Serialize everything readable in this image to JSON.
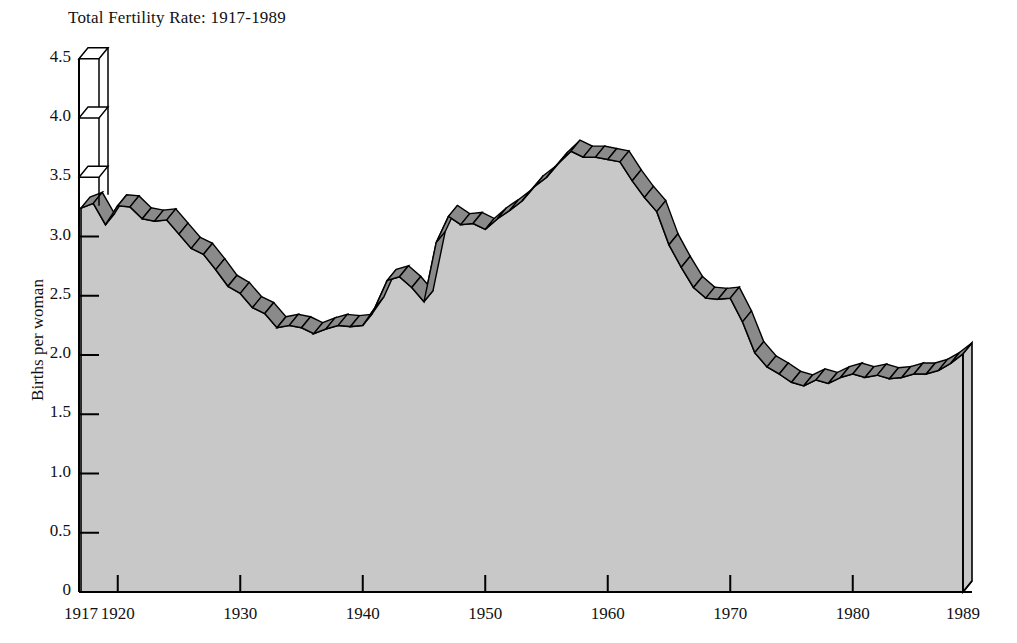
{
  "chart_data": {
    "type": "area",
    "title": "Total Fertility Rate: 1917-1989",
    "xlabel": "",
    "ylabel": "Births per woman",
    "style": "3d-ribbon-area",
    "grid": false,
    "legend": "none",
    "xlim": [
      1917,
      1989
    ],
    "ylim": [
      0,
      4.5
    ],
    "x_tick_labels": [
      "1917",
      "1920",
      "1930",
      "1940",
      "1950",
      "1960",
      "1970",
      "1980",
      "1989"
    ],
    "x_ticks": [
      1917,
      1920,
      1930,
      1940,
      1950,
      1960,
      1970,
      1980,
      1989
    ],
    "y_tick_labels": [
      "0",
      "0.5",
      "1.0",
      "1.5",
      "2.0",
      "2.5",
      "3.0",
      "3.5",
      "4.0",
      "4.5"
    ],
    "y_ticks": [
      0,
      0.5,
      1.0,
      1.5,
      2.0,
      2.5,
      3.0,
      3.5,
      4.0,
      4.5
    ],
    "x": [
      1917,
      1918,
      1919,
      1920,
      1921,
      1922,
      1923,
      1924,
      1925,
      1926,
      1927,
      1928,
      1929,
      1930,
      1931,
      1932,
      1933,
      1934,
      1935,
      1936,
      1937,
      1938,
      1939,
      1940,
      1941,
      1942,
      1943,
      1944,
      1945,
      1946,
      1947,
      1948,
      1949,
      1950,
      1951,
      1952,
      1953,
      1954,
      1955,
      1956,
      1957,
      1958,
      1959,
      1960,
      1961,
      1962,
      1963,
      1964,
      1965,
      1966,
      1967,
      1968,
      1969,
      1970,
      1971,
      1972,
      1973,
      1974,
      1975,
      1976,
      1977,
      1978,
      1979,
      1980,
      1981,
      1982,
      1983,
      1984,
      1985,
      1986,
      1987,
      1988,
      1989
    ],
    "values": [
      3.24,
      3.28,
      3.1,
      3.26,
      3.25,
      3.15,
      3.13,
      3.14,
      3.02,
      2.9,
      2.85,
      2.72,
      2.58,
      2.52,
      2.4,
      2.35,
      2.23,
      2.25,
      2.23,
      2.18,
      2.22,
      2.25,
      2.24,
      2.25,
      2.4,
      2.63,
      2.66,
      2.57,
      2.45,
      2.95,
      3.17,
      3.1,
      3.11,
      3.06,
      3.15,
      3.22,
      3.3,
      3.42,
      3.5,
      3.62,
      3.72,
      3.67,
      3.67,
      3.65,
      3.63,
      3.47,
      3.33,
      3.21,
      2.93,
      2.74,
      2.57,
      2.48,
      2.47,
      2.48,
      2.28,
      2.02,
      1.9,
      1.84,
      1.77,
      1.74,
      1.79,
      1.76,
      1.81,
      1.84,
      1.81,
      1.83,
      1.8,
      1.81,
      1.84,
      1.84,
      1.87,
      1.93,
      2.01
    ],
    "annotations": []
  },
  "colors": {
    "area_fill": "#c8c8c8",
    "ribbon_top": "#8a8a8a",
    "ribbon_side": "#9a9a9a",
    "outline": "#000000",
    "background": "#ffffff",
    "text": "#111111"
  }
}
